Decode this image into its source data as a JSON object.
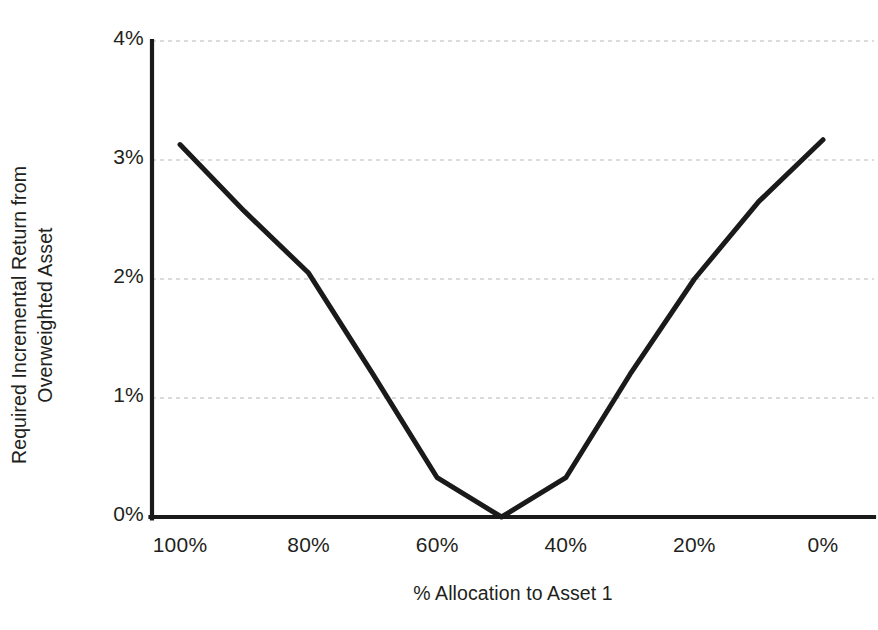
{
  "chart_data": {
    "type": "line",
    "title": "",
    "xlabel": "% Allocation to Asset 1",
    "ylabel_line1": "Required Incremental Return from",
    "ylabel_line2": "Overweighted Asset",
    "ylabel": "Required Incremental Return from Overweighted Asset",
    "x": [
      100,
      90,
      80,
      70,
      60,
      50,
      40,
      30,
      20,
      10,
      0
    ],
    "values": [
      3.13,
      2.57,
      2.05,
      1.2,
      0.33,
      0.0,
      0.33,
      1.2,
      2.0,
      2.65,
      3.17
    ],
    "series": [
      {
        "name": "Required incremental return",
        "values": [
          3.13,
          2.57,
          2.05,
          1.2,
          0.33,
          0.0,
          0.33,
          1.2,
          2.0,
          2.65,
          3.17
        ]
      }
    ],
    "x_tick_values": [
      100,
      80,
      60,
      40,
      20,
      0
    ],
    "x_tick_labels": [
      "100%",
      "80%",
      "60%",
      "40%",
      "20%",
      "0%"
    ],
    "y_tick_values": [
      0,
      1,
      2,
      3,
      4
    ],
    "y_tick_labels": [
      "0%",
      "1%",
      "2%",
      "3%",
      "4%"
    ],
    "xlim": [
      100,
      0
    ],
    "ylim": [
      0,
      4
    ],
    "grid": "horizontal-dashed",
    "legend": "none",
    "line_color": "#1a1a1a",
    "grid_color": "#cfcfcf",
    "axis_color": "#1a1a1a",
    "background_color": "#ffffff"
  },
  "axes": {
    "x_ticks": [
      {
        "label": "100%",
        "value": 100
      },
      {
        "label": "80%",
        "value": 80
      },
      {
        "label": "60%",
        "value": 60
      },
      {
        "label": "40%",
        "value": 40
      },
      {
        "label": "20%",
        "value": 20
      },
      {
        "label": "0%",
        "value": 0
      }
    ],
    "y_ticks": [
      {
        "label": "4%",
        "value": 4
      },
      {
        "label": "3%",
        "value": 3
      },
      {
        "label": "2%",
        "value": 2
      },
      {
        "label": "1%",
        "value": 1
      },
      {
        "label": "0%",
        "value": 0
      }
    ]
  }
}
